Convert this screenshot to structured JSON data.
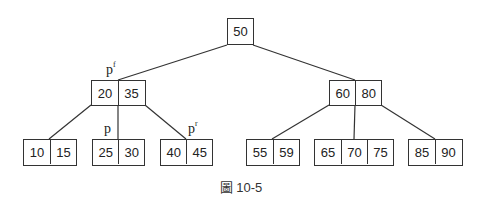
{
  "diagram": {
    "type": "B-tree",
    "caption": "圖 10-5",
    "root": {
      "keys": [
        "50"
      ]
    },
    "level1": [
      {
        "keys": [
          "20",
          "35"
        ],
        "pointer_label": "p",
        "pointer_sup": "f"
      },
      {
        "keys": [
          "60",
          "80"
        ]
      }
    ],
    "leaves": [
      {
        "keys": [
          "10",
          "15"
        ]
      },
      {
        "keys": [
          "25",
          "30"
        ],
        "pointer_label": "p"
      },
      {
        "keys": [
          "40",
          "45"
        ],
        "pointer_label": "p",
        "pointer_sup": "r"
      },
      {
        "keys": [
          "55",
          "59"
        ]
      },
      {
        "keys": [
          "65",
          "70",
          "75"
        ]
      },
      {
        "keys": [
          "85",
          "90"
        ]
      }
    ]
  }
}
